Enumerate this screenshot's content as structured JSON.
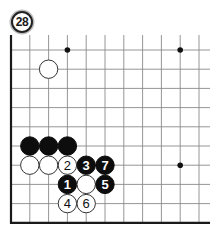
{
  "diagram": {
    "number": "28",
    "board": {
      "columns": 11,
      "rows": 10,
      "origin_x": 11,
      "origin_y": 50,
      "spacing_x": 18.8,
      "spacing_y": 19.2,
      "top_extension": 15,
      "right_extension": 11,
      "line_color": "#8a8a8a",
      "edge_color": "#1a1a1a",
      "edges": [
        "left",
        "bottom"
      ]
    },
    "star_points": [
      {
        "col": 3,
        "row": 0
      },
      {
        "col": 9,
        "row": 0
      },
      {
        "col": 9,
        "row": 6
      }
    ],
    "stones": [
      {
        "col": 2,
        "row": 1,
        "color": "white",
        "label": ""
      },
      {
        "col": 1,
        "row": 5,
        "color": "black",
        "label": ""
      },
      {
        "col": 2,
        "row": 5,
        "color": "black",
        "label": ""
      },
      {
        "col": 3,
        "row": 5,
        "color": "black",
        "label": ""
      },
      {
        "col": 1,
        "row": 6,
        "color": "white",
        "label": ""
      },
      {
        "col": 2,
        "row": 6,
        "color": "white",
        "label": ""
      },
      {
        "col": 3,
        "row": 6,
        "color": "white",
        "label": "2"
      },
      {
        "col": 4,
        "row": 6,
        "color": "black",
        "label": "3"
      },
      {
        "col": 5,
        "row": 6,
        "color": "black",
        "label": "7"
      },
      {
        "col": 3,
        "row": 7,
        "color": "black",
        "label": "1"
      },
      {
        "col": 4,
        "row": 7,
        "color": "white",
        "label": ""
      },
      {
        "col": 5,
        "row": 7,
        "color": "black",
        "label": "5"
      },
      {
        "col": 3,
        "row": 8,
        "color": "white",
        "label": "4"
      },
      {
        "col": 4,
        "row": 8,
        "color": "white",
        "label": "6"
      }
    ]
  }
}
